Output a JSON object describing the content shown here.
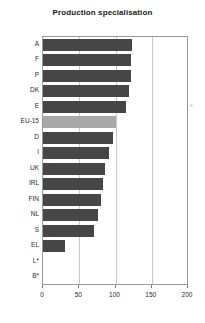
{
  "chart_data": {
    "type": "bar",
    "orientation": "horizontal",
    "title": "Production specialisation",
    "xlabel": "",
    "ylabel": "",
    "categories": [
      "A",
      "F",
      "P",
      "DK",
      "E",
      "EU-15",
      "D",
      "I",
      "UK",
      "IRL",
      "FIN",
      "NL",
      "S",
      "EL",
      "L*",
      "B*"
    ],
    "values": [
      123,
      122,
      122,
      118,
      114,
      101,
      97,
      91,
      85,
      83,
      80,
      76,
      70,
      30,
      0,
      0
    ],
    "xlim": [
      0,
      200
    ],
    "xticks": [
      0,
      50,
      100,
      150,
      200
    ],
    "xtick_labels": [
      "0",
      "50",
      "100",
      "150",
      "200"
    ],
    "grid": true,
    "legend": false,
    "highlight_category": "EU-15",
    "colors": {
      "bar": "#464646",
      "highlight_bar": "#a9a9a9",
      "gridline": "#c9c9c9",
      "axis": "#9a9a9a",
      "text": "#2a2a2a",
      "background": "#ffffff"
    }
  }
}
